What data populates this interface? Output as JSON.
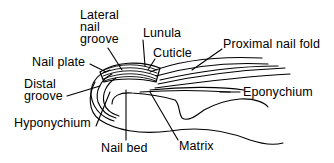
{
  "diagram": {
    "labels": {
      "lateral_nail_groove": [
        "Lateral",
        "nail",
        "groove"
      ],
      "lunula": "Lunula",
      "cuticle": "Cuticle",
      "proximal_nail_fold": "Proximal nail fold",
      "nail_plate": "Nail plate",
      "distal_groove": [
        "Distal",
        "groove"
      ],
      "eponychium": "Eponychium",
      "hyponychium": "Hyponychium",
      "nail_bed": "Nail bed",
      "matrix": "Matrix"
    },
    "colors": {
      "ink": "#000000",
      "background": "#ffffff"
    }
  }
}
